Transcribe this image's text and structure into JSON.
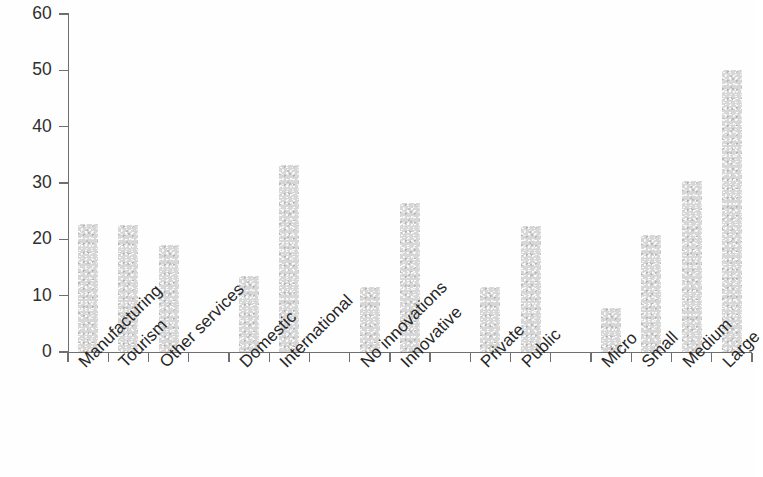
{
  "chart_data": {
    "type": "bar",
    "title": "",
    "subtitle": "",
    "xlabel": "",
    "ylabel": "",
    "ylim": [
      0,
      60
    ],
    "yticks": [
      0,
      10,
      20,
      30,
      40,
      50,
      60
    ],
    "ytick_labels": [
      "0",
      "10",
      "20",
      "30",
      "40",
      "50",
      "60"
    ],
    "grid": false,
    "legend": null,
    "legend_position": "none",
    "orientation": "vertical",
    "bar_color": "#d7d7d7",
    "axis_color": "#6f6f6f",
    "text_color": "#262626",
    "label_rotation": -45,
    "categories": [
      "Manufacturing",
      "Tourism",
      "Other services",
      "Domestic",
      "International",
      "No innovations",
      "Innovative",
      "Private",
      "Public",
      "Micro",
      "Small",
      "Medium",
      "Large"
    ],
    "values": [
      22.7,
      22.5,
      19.0,
      13.5,
      33.2,
      11.5,
      26.4,
      11.6,
      22.3,
      7.8,
      20.7,
      30.4,
      50.0
    ],
    "groups": [
      {
        "name": "Sector",
        "categories": [
          "Manufacturing",
          "Tourism",
          "Other services"
        ]
      },
      {
        "name": "Market",
        "categories": [
          "Domestic",
          "International"
        ]
      },
      {
        "name": "Innovation",
        "categories": [
          "No innovations",
          "Innovative"
        ]
      },
      {
        "name": "Ownership",
        "categories": [
          "Private",
          "Public"
        ]
      },
      {
        "name": "Size",
        "categories": [
          "Micro",
          "Small",
          "Medium",
          "Large"
        ]
      }
    ],
    "bars": [
      {
        "label": "Manufacturing",
        "value": 22.7,
        "slot": 0
      },
      {
        "label": "Tourism",
        "value": 22.5,
        "slot": 1
      },
      {
        "label": "Other services",
        "value": 19.0,
        "slot": 2
      },
      {
        "label": "Domestic",
        "value": 13.5,
        "slot": 4
      },
      {
        "label": "International",
        "value": 33.2,
        "slot": 5
      },
      {
        "label": "No innovations",
        "value": 11.5,
        "slot": 7
      },
      {
        "label": "Innovative",
        "value": 26.4,
        "slot": 8
      },
      {
        "label": "Private",
        "value": 11.6,
        "slot": 10
      },
      {
        "label": "Public",
        "value": 22.3,
        "slot": 11
      },
      {
        "label": "Micro",
        "value": 7.8,
        "slot": 13
      },
      {
        "label": "Small",
        "value": 20.7,
        "slot": 14
      },
      {
        "label": "Medium",
        "value": 30.4,
        "slot": 15
      },
      {
        "label": "Large",
        "value": 50.0,
        "slot": 16
      }
    ],
    "n_slots": 17
  }
}
